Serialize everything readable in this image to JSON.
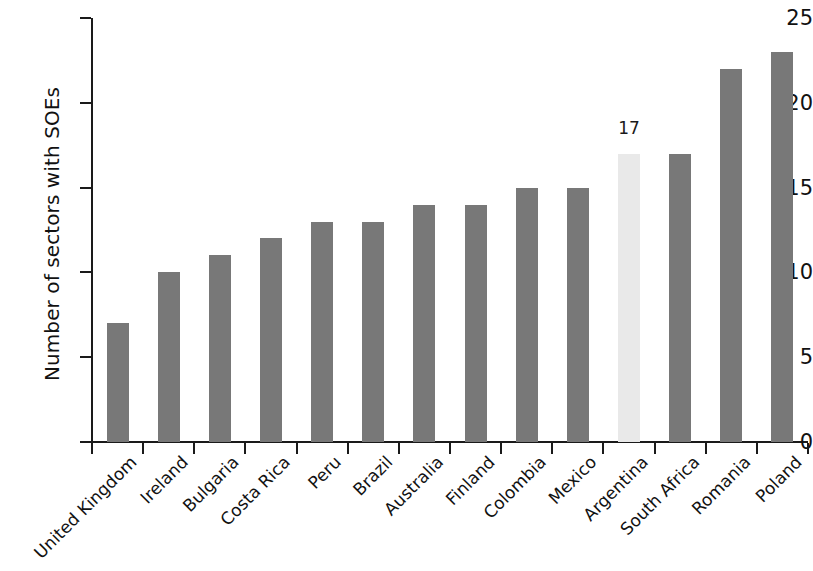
{
  "chart_data": {
    "type": "bar",
    "title": "",
    "subtitle": "",
    "xlabel": "",
    "ylabel": "Number of sectors with SOEs",
    "ylim": [
      0,
      25
    ],
    "yticks": [
      0,
      5,
      10,
      15,
      20,
      25
    ],
    "grid": false,
    "legend": "none",
    "orientation": "vertical",
    "categories": [
      "United Kingdom",
      "Ireland",
      "Bulgaria",
      "Costa Rica",
      "Peru",
      "Brazil",
      "Australia",
      "Finland",
      "Colombia",
      "Mexico",
      "Argentina",
      "South Africa",
      "Romania",
      "Poland"
    ],
    "values": [
      7,
      10,
      11,
      12,
      13,
      13,
      14,
      14,
      15,
      15,
      17,
      17,
      22,
      23
    ],
    "highlight_category": "Argentina",
    "highlight_index": 10,
    "data_labels": [
      null,
      null,
      null,
      null,
      null,
      null,
      null,
      null,
      null,
      null,
      "17",
      null,
      null,
      null
    ],
    "colors": {
      "bar": "#787878",
      "bar_highlight": "#e9e9e9",
      "axis": "#1a1a1a",
      "text": "#111111"
    }
  },
  "axis": {
    "y_title": "Number of sectors with SOEs",
    "y_tick_labels": [
      "0",
      "5",
      "10",
      "15",
      "20",
      "25"
    ]
  }
}
